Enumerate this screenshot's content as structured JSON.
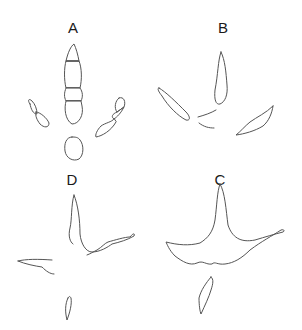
{
  "figure": {
    "panels": [
      {
        "label": "A",
        "description": "footprint with segmented toe pads"
      },
      {
        "label": "B",
        "description": "footprint with slender separated toe pads"
      },
      {
        "label": "C",
        "description": "webbed footprint with hind toe"
      },
      {
        "label": "D",
        "description": "outline footprint with hind toe"
      }
    ],
    "colors": {
      "stroke": "#555555",
      "label": "#1a1a1a",
      "background": "#ffffff"
    }
  }
}
